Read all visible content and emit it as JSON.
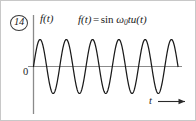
{
  "figure": {
    "problem_number": "14",
    "y_axis_label": "f(t)",
    "origin_label": "0",
    "t_axis_label": "t",
    "equation": {
      "lhs": "f(t)",
      "equals": "=",
      "function_name": "sin",
      "omega": "ω",
      "omega_subscript": "0",
      "variable": "t",
      "step_function": "u(t)",
      "full_text": "f(t) = sin ω0tu(t)"
    },
    "colors": {
      "curve": "#1a1a1a",
      "axis": "#7d7d7d",
      "text": "#1a1a1a",
      "background": "#ffffff",
      "border": "#c8c8c8"
    }
  },
  "chart_data": {
    "type": "line",
    "xlabel": "t",
    "ylabel": "f(t)",
    "xlim": [
      0,
      5.5
    ],
    "ylim": [
      -1.15,
      1.15
    ],
    "grid": false,
    "legend": null,
    "series": [
      {
        "name": "sin ω0t u(t)",
        "function": "sin(2*pi*x)",
        "amplitude": 1,
        "cycles": 5.5,
        "phase": 0,
        "starts_at_origin": true
      }
    ],
    "annotations": [
      {
        "text": "14",
        "kind": "problem-number",
        "position": "top-left"
      },
      {
        "text": "f(t)",
        "kind": "y-axis-label",
        "position": "top-of-vertical-axis"
      },
      {
        "text": "f(t) = sin ω0tu(t)",
        "kind": "equation",
        "position": "top-center"
      },
      {
        "text": "0",
        "kind": "origin-label",
        "position": "origin-left"
      },
      {
        "text": "t",
        "kind": "x-axis-label",
        "position": "bottom-right"
      }
    ]
  }
}
